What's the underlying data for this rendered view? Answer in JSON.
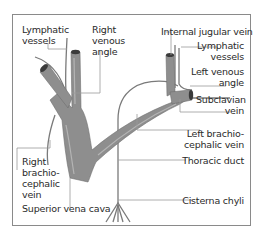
{
  "figure": {
    "type": "anatomical-diagram",
    "colors": {
      "vein_fill": "#8e8e8e",
      "vein_highlight": "#b4b4b4",
      "vein_lumen": "#3a3a3a",
      "lymph_vessel": "#7a7a7a",
      "leader_line": "#9a9a9a",
      "frame": "#8a8a8a",
      "text": "#2a2a2a"
    }
  },
  "labels": {
    "lymphatic_vessels_left": "Lymphatic\nvessels",
    "right_venous_angle": "Right\nvenous\nangle",
    "internal_jugular_vein": "Internal jugular vein",
    "lymphatic_vessels_right": "Lymphatic\nvessels",
    "left_venous_angle": "Left venous\nangle",
    "subclavian_vein": "Subclavian\nvein",
    "left_brachiocephalic_vein": "Left brachio-\ncephalic vein",
    "right_brachiocephalic_vein": "Right\nbrachio-\ncephalic\nvein",
    "thoracic_duct": "Thoracic duct",
    "superior_vena_cava": "Superior vena cava",
    "cisterna_chyli": "Cisterna chyli"
  }
}
